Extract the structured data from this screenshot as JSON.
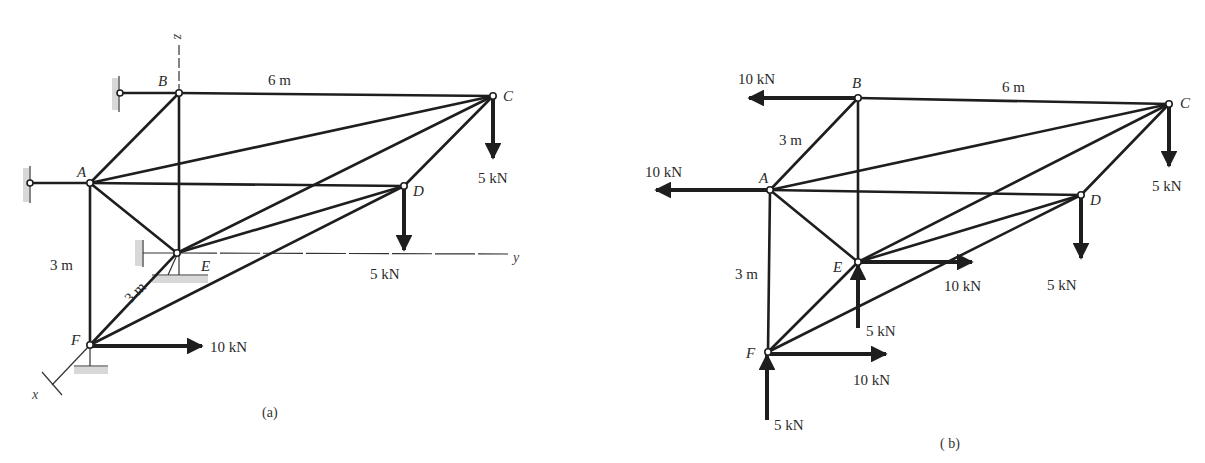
{
  "figure_a": {
    "caption": "(a)",
    "nodes": {
      "A": "A",
      "B": "B",
      "C": "C",
      "D": "D",
      "E": "E",
      "F": "F"
    },
    "axes": {
      "x": "x",
      "y": "y",
      "z": "z"
    },
    "dimensions": {
      "BC": "6 m",
      "AF": "3 m",
      "EF": "3 m"
    },
    "loads": {
      "C": "5 kN",
      "D": "5 kN",
      "F": "10 kN"
    }
  },
  "figure_b": {
    "caption": "( b)",
    "nodes": {
      "A": "A",
      "B": "B",
      "C": "C",
      "D": "D",
      "E": "E",
      "F": "F"
    },
    "dimensions": {
      "BC": "6 m",
      "AB": "3 m",
      "AF": "3 m"
    },
    "loads": {
      "B_reaction": "10 kN",
      "A_reaction": "10 kN",
      "C": "5 kN",
      "D": "5 kN",
      "E_horizontal": "10 kN",
      "E_vertical": "5 kN",
      "F_horizontal": "10 kN",
      "F_vertical": "5 kN"
    }
  }
}
